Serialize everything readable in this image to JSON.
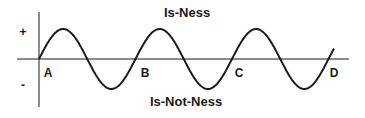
{
  "diagram": {
    "title_top": "Is-Ness",
    "title_bottom": "Is-Not-Ness",
    "plus_label": "+",
    "minus_label": "-",
    "points": [
      "A",
      "B",
      "C",
      "D"
    ],
    "line_color": "#1a1a1a",
    "wave": {
      "type": "sine",
      "start_x": 39,
      "axis_y": 59,
      "amplitude": 30,
      "period": 96.5,
      "end_x": 334
    }
  }
}
